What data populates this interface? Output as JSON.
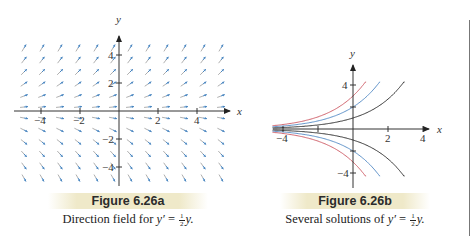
{
  "figure_a": {
    "header": "Figure 6.26a",
    "caption_prefix": "Direction field for ",
    "caption_var": "y′",
    "caption_eq": " = ",
    "caption_frac_num": "1",
    "caption_frac_den": "2",
    "caption_suffix": "y.",
    "axis": {
      "x_label": "x",
      "y_label": "y",
      "x_ticks": [
        "−4",
        "−2",
        "2",
        "4"
      ],
      "y_ticks": [
        "4",
        "2",
        "−2",
        "−4"
      ]
    },
    "arrow_color": "#4a86c0",
    "arrow_tail_color": "#9a9a9a",
    "equation": "y' = 1/2 y"
  },
  "figure_b": {
    "header": "Figure 6.26b",
    "caption_prefix": "Several solutions of ",
    "caption_var": "y′",
    "caption_eq": " = ",
    "caption_frac_num": "1",
    "caption_frac_den": "2",
    "caption_suffix": "y.",
    "axis": {
      "x_label": "x",
      "y_label": "y",
      "x_ticks": [
        "−4",
        "2",
        "4"
      ],
      "y_ticks": [
        "4",
        "−4"
      ]
    },
    "curves": [
      {
        "name": "y = 3e^{x/2}",
        "c": 3,
        "color": "#d0606a"
      },
      {
        "name": "y = 2e^{x/2}",
        "c": 2,
        "color": "#5a8fc8"
      },
      {
        "name": "y = e^{x/2}",
        "c": 1,
        "color": "#333333"
      },
      {
        "name": "y = -e^{x/2}",
        "c": -1,
        "color": "#333333"
      },
      {
        "name": "y = -2e^{x/2}",
        "c": -2,
        "color": "#5a8fc8"
      },
      {
        "name": "y = -3e^{x/2}",
        "c": -3,
        "color": "#d0606a"
      }
    ]
  },
  "colors": {
    "axis": "#333333",
    "header_band": "#efe9c9",
    "rule": "#777777"
  }
}
